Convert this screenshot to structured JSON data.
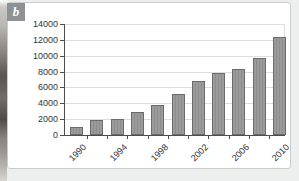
{
  "panel": {
    "badge": "b"
  },
  "chart_data": {
    "type": "bar",
    "x": [
      1990,
      1992,
      1994,
      1996,
      1998,
      2000,
      2002,
      2004,
      2006,
      2008,
      2010
    ],
    "values": [
      1000,
      1900,
      2000,
      2900,
      3800,
      5200,
      6800,
      7800,
      8300,
      9700,
      12300
    ],
    "x_tick_labels": [
      "1990",
      "1994",
      "1998",
      "2002",
      "2006",
      "2010"
    ],
    "y_ticks": [
      0,
      2000,
      4000,
      6000,
      8000,
      10000,
      12000,
      14000
    ],
    "ylim": [
      0,
      14000
    ],
    "title": "",
    "xlabel": "",
    "ylabel": "",
    "grid": true,
    "legend": "none",
    "bar_color": "#969696",
    "bar_border": "#6b6b6b"
  },
  "colors": {
    "page_bg": "#edefee",
    "panel_bg": "#ffffff",
    "panel_border": "#c9ccca",
    "badge_bg": "#8f9194",
    "grid": "#dcdedc",
    "axis": "#4d4d4d"
  }
}
